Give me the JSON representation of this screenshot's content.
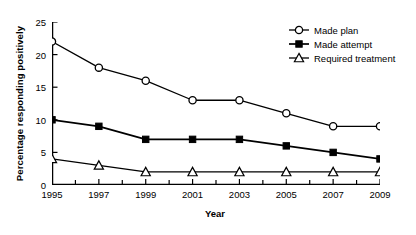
{
  "chart_data": {
    "type": "line",
    "title": "",
    "xlabel": "Year",
    "ylabel": "Percentage responding positively",
    "categories": [
      1995,
      1997,
      1999,
      2001,
      2003,
      2005,
      2007,
      2009
    ],
    "xtick_labels": [
      "1995",
      "1997",
      "1999",
      "2001",
      "2003",
      "2005",
      "2007",
      "2009"
    ],
    "ytick_labels": [
      "0",
      "5",
      "10",
      "15",
      "20",
      "25"
    ],
    "ytick_values": [
      0,
      5,
      10,
      15,
      20,
      25
    ],
    "xlim": [
      1995,
      2009
    ],
    "ylim": [
      0,
      25
    ],
    "grid": false,
    "legend_position": "top-right",
    "series": [
      {
        "name": "Made plan",
        "marker": "open-circle",
        "values": [
          22,
          18,
          16,
          13,
          13,
          11,
          9,
          9
        ]
      },
      {
        "name": "Made attempt",
        "marker": "filled-square",
        "values": [
          10,
          9,
          7,
          7,
          7,
          6,
          5,
          4
        ]
      },
      {
        "name": "Required treatment",
        "marker": "open-triangle",
        "values": [
          4,
          3,
          2,
          2,
          2,
          2,
          2,
          2
        ]
      }
    ]
  },
  "colors": {
    "line": "#000000",
    "axis": "#000000",
    "background": "#ffffff",
    "marker_fill": "#ffffff"
  }
}
